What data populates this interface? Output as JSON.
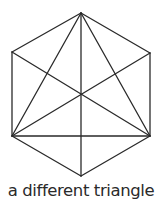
{
  "caption": "a different triangle",
  "colors": {
    "stroke": "#2a2a2a",
    "background": "#ffffff",
    "text": "#2a2a2a"
  },
  "diagram": {
    "vertices": {
      "top": [
        81,
        13
      ],
      "upper_left": [
        12,
        52
      ],
      "upper_right": [
        150,
        53
      ],
      "lower_left": [
        12,
        136
      ],
      "lower_right": [
        150,
        136
      ],
      "bottom": [
        81,
        176
      ]
    },
    "hexagon_edges": [
      [
        "top",
        "upper_right"
      ],
      [
        "upper_right",
        "lower_right"
      ],
      [
        "lower_right",
        "bottom"
      ],
      [
        "bottom",
        "lower_left"
      ],
      [
        "lower_left",
        "upper_left"
      ],
      [
        "upper_left",
        "top"
      ]
    ],
    "inner_lines": [
      [
        "top",
        "bottom"
      ],
      [
        "top",
        "lower_left"
      ],
      [
        "top",
        "lower_right"
      ],
      [
        "lower_left",
        "lower_right"
      ],
      [
        "upper_left",
        "lower_right"
      ],
      [
        "upper_right",
        "lower_left"
      ]
    ]
  }
}
